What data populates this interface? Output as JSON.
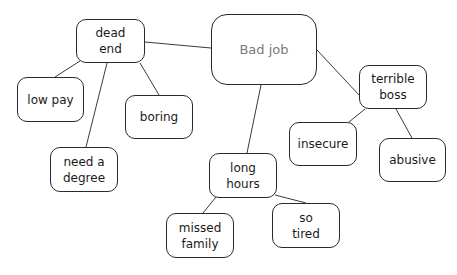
{
  "diagram": {
    "type": "mind-map",
    "central": {
      "id": "bad-job",
      "label": "Bad job"
    },
    "nodes": [
      {
        "id": "bad-job",
        "label": "Bad job",
        "x": 211,
        "y": 14,
        "w": 106,
        "h": 71,
        "central": true
      },
      {
        "id": "dead-end",
        "label": "dead\nend",
        "x": 76,
        "y": 19,
        "w": 69,
        "h": 44
      },
      {
        "id": "terrible-boss",
        "label": "terrible\nboss",
        "x": 359,
        "y": 65,
        "w": 68,
        "h": 44
      },
      {
        "id": "low-pay",
        "label": "low pay",
        "x": 17,
        "y": 77,
        "w": 67,
        "h": 45
      },
      {
        "id": "boring",
        "label": "boring",
        "x": 125,
        "y": 95,
        "w": 68,
        "h": 44
      },
      {
        "id": "need-a-degree",
        "label": "need a\ndegree",
        "x": 50,
        "y": 147,
        "w": 68,
        "h": 45
      },
      {
        "id": "insecure",
        "label": "insecure",
        "x": 289,
        "y": 122,
        "w": 68,
        "h": 44
      },
      {
        "id": "abusive",
        "label": "abusive",
        "x": 379,
        "y": 138,
        "w": 67,
        "h": 44
      },
      {
        "id": "long-hours",
        "label": "long\nhours",
        "x": 209,
        "y": 153,
        "w": 68,
        "h": 45
      },
      {
        "id": "missed-family",
        "label": "missed\nfamily",
        "x": 166,
        "y": 213,
        "w": 68,
        "h": 45
      },
      {
        "id": "so-tired",
        "label": "so\ntired",
        "x": 272,
        "y": 203,
        "w": 68,
        "h": 45
      }
    ],
    "edges": [
      {
        "from": "bad-job",
        "to": "dead-end",
        "x1": 211,
        "y1": 48,
        "x2": 145,
        "y2": 42
      },
      {
        "from": "bad-job",
        "to": "terrible-boss",
        "x1": 317,
        "y1": 50,
        "x2": 359,
        "y2": 95
      },
      {
        "from": "bad-job",
        "to": "long-hours",
        "x1": 261,
        "y1": 85,
        "x2": 247,
        "y2": 153
      },
      {
        "from": "dead-end",
        "to": "low-pay",
        "x1": 80,
        "y1": 61,
        "x2": 55,
        "y2": 77
      },
      {
        "from": "dead-end",
        "to": "boring",
        "x1": 140,
        "y1": 63,
        "x2": 159,
        "y2": 95
      },
      {
        "from": "dead-end",
        "to": "need-a-degree",
        "x1": 107,
        "y1": 63,
        "x2": 86,
        "y2": 147
      },
      {
        "from": "terrible-boss",
        "to": "insecure",
        "x1": 365,
        "y1": 109,
        "x2": 349,
        "y2": 122
      },
      {
        "from": "terrible-boss",
        "to": "abusive",
        "x1": 396,
        "y1": 109,
        "x2": 412,
        "y2": 138
      },
      {
        "from": "long-hours",
        "to": "missed-family",
        "x1": 216,
        "y1": 197,
        "x2": 203,
        "y2": 213
      },
      {
        "from": "long-hours",
        "to": "so-tired",
        "x1": 275,
        "y1": 195,
        "x2": 306,
        "y2": 203
      }
    ],
    "colors": {
      "background": "#ffffff",
      "border": "#2a2a2a",
      "edge": "#3a3a3a",
      "central_text": "#7a7a7a",
      "node_text": "#1a1a1a"
    }
  }
}
